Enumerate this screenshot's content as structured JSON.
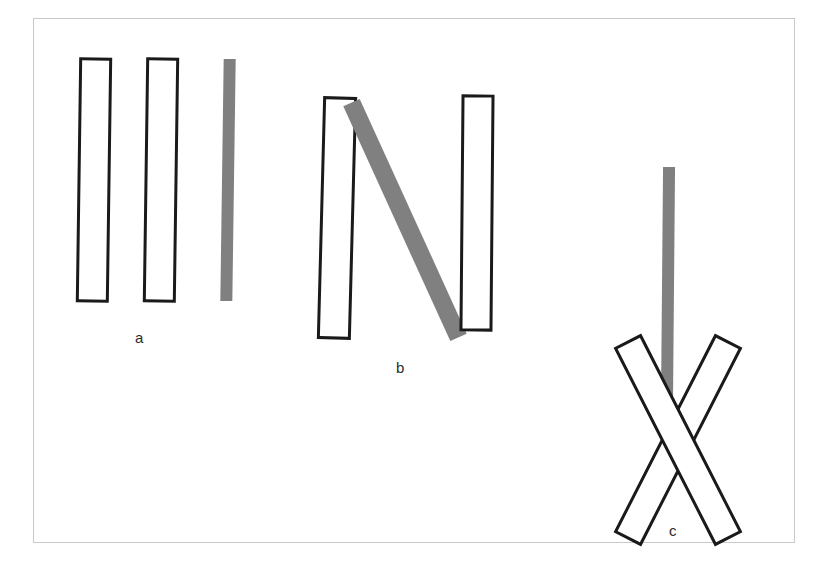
{
  "figure": {
    "title": "",
    "background_color": "#ffffff",
    "frame": {
      "border_color": "#c9c9c9",
      "x": 33,
      "y": 18,
      "width": 762,
      "height": 525
    },
    "outline_color": "#1a1a1a",
    "outline_width": 3,
    "fill_color": "#ffffff",
    "gray_color": "#808080",
    "label_color": "#2b2b2b"
  },
  "panels": [
    {
      "id": "a",
      "label": "a",
      "label_x": 135,
      "label_y": 330,
      "description": "three parallel vertical bars; two outlined, one gray-filled",
      "bars": [
        {
          "name": "bar-a-1",
          "style": "outlined",
          "cx": 94,
          "cy": 180,
          "length": 242,
          "thickness": 30,
          "angle": 0.8
        },
        {
          "name": "bar-a-2",
          "style": "outlined",
          "cx": 161,
          "cy": 180,
          "length": 242,
          "thickness": 30,
          "angle": 0.8
        },
        {
          "name": "bar-a-3",
          "style": "gray",
          "cx": 228,
          "cy": 180,
          "length": 242,
          "thickness": 12,
          "angle": 0.8
        }
      ]
    },
    {
      "id": "b",
      "label": "b",
      "label_x": 396,
      "label_y": 360,
      "description": "two near-vertical outlined bars flanking one steeply tilted gray bar",
      "bars": [
        {
          "name": "bar-b-1",
          "style": "outlined",
          "cx": 337,
          "cy": 218,
          "length": 240,
          "thickness": 31,
          "angle": 1.5
        },
        {
          "name": "bar-b-2",
          "style": "gray",
          "cx": 405,
          "cy": 220,
          "length": 258,
          "thickness": 18,
          "angle": -24.5
        },
        {
          "name": "bar-b-3",
          "style": "outlined",
          "cx": 477,
          "cy": 213,
          "length": 234,
          "thickness": 30,
          "angle": 0.5
        }
      ]
    },
    {
      "id": "c",
      "label": "c",
      "label_x": 669,
      "label_y": 523,
      "description": "two outlined bars crossing in an X with one vertical gray bar above the crossing",
      "bars": [
        {
          "name": "bar-c-1",
          "style": "gray",
          "cx": 668,
          "cy": 287,
          "length": 240,
          "thickness": 12,
          "angle": 0.5
        },
        {
          "name": "bar-c-2",
          "style": "outlined",
          "cx": 678,
          "cy": 440,
          "length": 220,
          "thickness": 28,
          "angle": 27
        },
        {
          "name": "bar-c-3",
          "style": "outlined",
          "cx": 678,
          "cy": 440,
          "length": 220,
          "thickness": 28,
          "angle": -27
        }
      ]
    }
  ]
}
